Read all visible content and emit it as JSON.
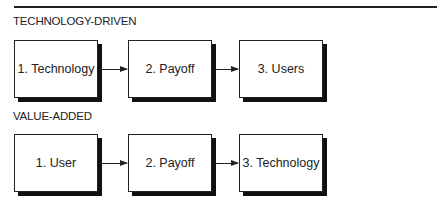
{
  "diagram": {
    "sections": [
      {
        "title": "TECHNOLOGY-DRIVEN",
        "steps": [
          {
            "label": "1.  Technology"
          },
          {
            "label": "2.  Payoff"
          },
          {
            "label": "3. Users"
          }
        ]
      },
      {
        "title": "VALUE-ADDED",
        "steps": [
          {
            "label": "1.  User"
          },
          {
            "label": "2. Payoff"
          },
          {
            "label": "3. Technology"
          }
        ]
      }
    ],
    "colors": {
      "line": "#222222",
      "shadow": "#111111",
      "background": "#ffffff"
    }
  }
}
